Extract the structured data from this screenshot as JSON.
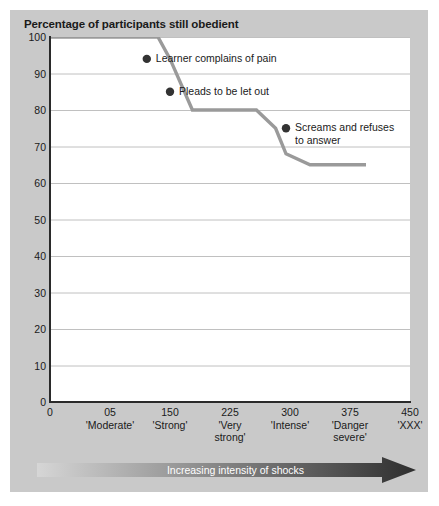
{
  "figure": {
    "panel_color": "#c9c9c9",
    "plot_background": "#ffffff",
    "axis_color": "#2a2a2a",
    "gridline_color": "#c0c0c0",
    "line_color": "#9a9a9a",
    "marker_color": "#333333",
    "arrow_label": "Increasing intensity of shocks",
    "arrow_light": "#d6d6d6",
    "arrow_dark": "#2e2e2e"
  },
  "chart_data": {
    "type": "line",
    "title": "Percentage of participants still obedient",
    "xlabel": "Increasing intensity of shocks",
    "ylabel": "Percentage of participants still obedient",
    "xlim": [
      0,
      450
    ],
    "ylim": [
      0,
      100
    ],
    "grid": true,
    "legend": "none",
    "y_ticks": [
      100,
      90,
      80,
      70,
      60,
      50,
      40,
      30,
      20,
      10,
      0
    ],
    "x_ticks": [
      {
        "value": 0,
        "num": "0",
        "label": ""
      },
      {
        "value": 75,
        "num": "05",
        "label": "'Moderate'"
      },
      {
        "value": 150,
        "num": "150",
        "label": "'Strong'"
      },
      {
        "value": 225,
        "num": "225",
        "label": "'Very\nstrong'"
      },
      {
        "value": 300,
        "num": "300",
        "label": "'Intense'"
      },
      {
        "value": 375,
        "num": "375",
        "label": "'Danger\nsevere'"
      },
      {
        "value": 450,
        "num": "450",
        "label": "'XXX'"
      }
    ],
    "series": [
      {
        "name": "Participants still obedient",
        "x": [
          0,
          112,
          135,
          150,
          178,
          258,
          282,
          295,
          325,
          395
        ],
        "values": [
          100,
          100,
          100,
          94,
          80,
          80,
          75,
          68,
          65,
          65
        ]
      }
    ],
    "annotations": [
      {
        "text": "Learner complains of pain",
        "x": 121,
        "y": 94,
        "marker": true
      },
      {
        "text": "Pleads to be let out",
        "x": 150,
        "y": 85,
        "marker": true
      },
      {
        "text": "Screams and refuses\nto answer",
        "x": 295,
        "y": 75,
        "marker": true
      }
    ]
  }
}
